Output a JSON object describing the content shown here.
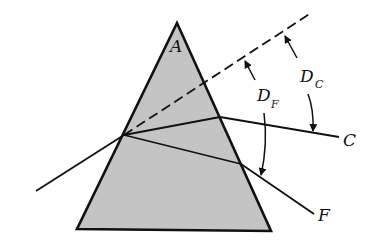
{
  "figure": {
    "colors": {
      "background": "#ffffff",
      "prism_fill": "#c4c4c4",
      "stroke": "#111111"
    }
  },
  "labels": {
    "apex": "A",
    "ray_c": "C",
    "ray_f": "F",
    "deviation_c_main": "D",
    "deviation_c_sub": "C",
    "deviation_f_main": "D",
    "deviation_f_sub": "F"
  },
  "geometry": {
    "prism": {
      "apex": [
        177,
        23
      ],
      "bottom_left": [
        77,
        229
      ],
      "bottom_right": [
        271,
        231
      ]
    },
    "incident_ray": {
      "start": [
        36,
        191
      ],
      "entry": [
        124,
        135
      ]
    },
    "undeviated_dashed": {
      "start": [
        124,
        135
      ],
      "end": [
        311,
        13
      ]
    },
    "ray_c": {
      "exit": [
        220,
        117
      ],
      "end": [
        339,
        137
      ]
    },
    "ray_f": {
      "exit": [
        241,
        164
      ],
      "end": [
        314,
        214
      ]
    }
  }
}
